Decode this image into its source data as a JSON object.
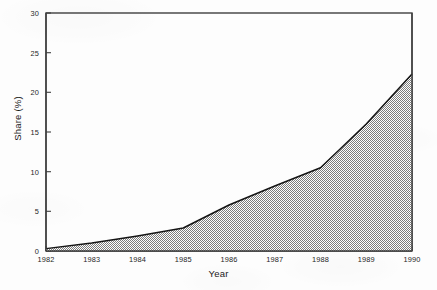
{
  "chart_data": {
    "type": "area",
    "title": "",
    "subtitle": "",
    "xlabel": "Year",
    "ylabel": "Share (%)",
    "x": [
      1982,
      1983,
      1984,
      1985,
      1986,
      1987,
      1988,
      1989,
      1990
    ],
    "values": [
      0.3,
      1.0,
      1.9,
      2.9,
      5.8,
      8.2,
      10.5,
      16.0,
      22.3
    ],
    "series": [
      {
        "name": "Share",
        "values": [
          0.3,
          1.0,
          1.9,
          2.9,
          5.8,
          8.2,
          10.5,
          16.0,
          22.3
        ]
      }
    ],
    "categories": [
      "1982",
      "1983",
      "1984",
      "1985",
      "1986",
      "1987",
      "1988",
      "1989",
      "1990"
    ],
    "xlim": [
      1982,
      1990
    ],
    "ylim": [
      0,
      30
    ],
    "xticks": [
      "1982",
      "1983",
      "1984",
      "1985",
      "1986",
      "1987",
      "1988",
      "1989",
      "1990"
    ],
    "yticks": [
      "0",
      "5",
      "10",
      "15",
      "20",
      "25",
      "30"
    ],
    "ytick_values": [
      0,
      5,
      10,
      15,
      20,
      25,
      30
    ],
    "grid": false,
    "legend": "none",
    "fill_style": "50% gray checkerboard dither",
    "colors": {
      "axis": "#3a3a3a",
      "line": "#1a1a1a",
      "fill_light": "#ffffff",
      "fill_dark": "#8c8c8c",
      "background": "#fdfdfd",
      "text": "#1f1f1f"
    }
  }
}
